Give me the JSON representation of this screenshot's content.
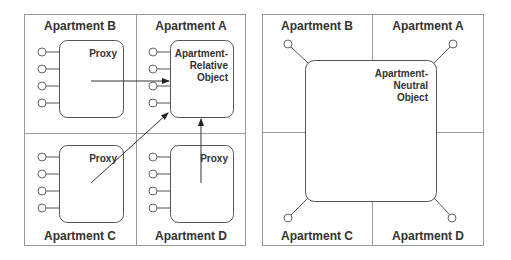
{
  "left_panel": {
    "name": "apartment-relative-model",
    "apartments": {
      "top_left": "Apartment B",
      "top_right": "Apartment A",
      "bottom_left": "Apartment C",
      "bottom_right": "Apartment D"
    },
    "boxes": {
      "b": {
        "label": "Proxy",
        "interfaces": 4
      },
      "a": {
        "label_lines": [
          "Apartment-",
          "Relative",
          "Object"
        ],
        "interfaces": 4
      },
      "c": {
        "label": "Proxy",
        "interfaces": 4
      },
      "d": {
        "label": "Proxy",
        "interfaces": 4
      }
    },
    "arrows": [
      {
        "from": "Proxy (Apartment B)",
        "to": "Apartment-Relative Object"
      },
      {
        "from": "Proxy (Apartment C)",
        "to": "Apartment-Relative Object"
      },
      {
        "from": "Proxy (Apartment D)",
        "to": "Apartment-Relative Object"
      }
    ]
  },
  "right_panel": {
    "name": "apartment-neutral-model",
    "apartments": {
      "top_left": "Apartment B",
      "top_right": "Apartment A",
      "bottom_left": "Apartment C",
      "bottom_right": "Apartment D"
    },
    "box": {
      "label_lines": [
        "Apartment-",
        "Neutral",
        "Object"
      ],
      "interfaces": 4
    }
  },
  "colors": {
    "frame": "#9a9a9a",
    "box_stroke": "#555555",
    "text": "#333333",
    "background": "#ffffff"
  }
}
